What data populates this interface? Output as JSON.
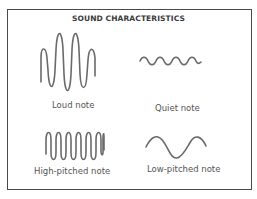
{
  "title": "SOUND CHARACTERISTICS",
  "panels": [
    {
      "id": "loud",
      "label": "Loud note"
    },
    {
      "id": "quiet",
      "label": "Quiet note"
    },
    {
      "id": "high",
      "label": "High-pitched note"
    },
    {
      "id": "low",
      "label": "Low-pitched note"
    }
  ],
  "colors": {
    "border": "#4a4a4a",
    "wave": "#6a6a6a",
    "text": "#555555"
  }
}
